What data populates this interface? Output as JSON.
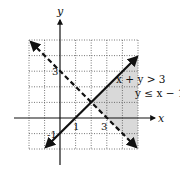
{
  "figure": {
    "axis_labels": {
      "x": "x",
      "y": "y"
    },
    "tick_labels": {
      "y_3": "3",
      "x_1": "1",
      "x_3": "3",
      "neg_1": "-1"
    },
    "inequalities": {
      "first": "x + y > 3",
      "second": "y ≤ x − 1"
    },
    "grid": {
      "xmin": -2,
      "xmax": 5,
      "ymin": -2,
      "ymax": 5,
      "step": 1
    },
    "lines": [
      {
        "equation": "y = x - 1",
        "style": "solid"
      },
      {
        "equation": "x + y = 3",
        "style": "dashed"
      }
    ],
    "intersection": [
      2,
      1
    ],
    "colors": {
      "shade": "#d9d9d9",
      "grid": "#555555",
      "line": "#111111"
    }
  }
}
